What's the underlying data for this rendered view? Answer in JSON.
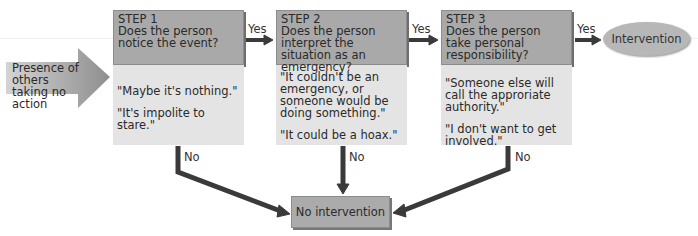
{
  "diagram": {
    "input": {
      "label": "Presence of others taking no action"
    },
    "steps": [
      {
        "title": "STEP 1",
        "question": "Does the person notice the event?",
        "quotes": [
          "\"Maybe it's nothing.\"",
          "\"It's impolite to stare.\""
        ]
      },
      {
        "title": "STEP 2",
        "question": "Does the person interpret the situation as an emergency?",
        "quotes": [
          "\"It couldn't be an emergency, or someone would be doing something.\"",
          "\"It could be a hoax.\""
        ]
      },
      {
        "title": "STEP 3",
        "question": "Does the person take personal responsibility?",
        "quotes": [
          "\"Someone else will call the approriate authority.\"",
          "\"I don't want to get involved.\""
        ]
      }
    ],
    "yes_label": "Yes",
    "no_label": "No",
    "outcome_yes": "Intervention",
    "outcome_no": "No intervention",
    "colors": {
      "header_fill": "#a9a9a9",
      "body_fill": "#e4e4e4",
      "arrow": "#3a3a3a",
      "input_arrow": "#9a9a9a"
    }
  }
}
